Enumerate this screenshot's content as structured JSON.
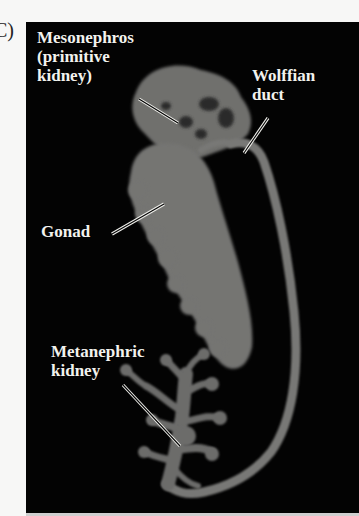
{
  "figure": {
    "panel_letter": "C)",
    "background_color": "#030303",
    "tissue_color": "#7a7a78",
    "label_color": "#f2f2ee",
    "labels": {
      "mesonephros": {
        "line1": "Mesonephros",
        "line2": "(primitive",
        "line3": "kidney)"
      },
      "wolffian_duct": {
        "line1": "Wolffian",
        "line2": "duct"
      },
      "gonad": {
        "line1": "Gonad"
      },
      "metanephric_kidney": {
        "line1": "Metanephric",
        "line2": "kidney"
      }
    }
  }
}
